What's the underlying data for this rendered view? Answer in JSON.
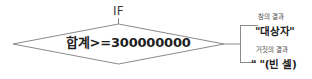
{
  "diagram": {
    "type": "if-decision-flowchart",
    "keyword_label": "IF",
    "decision": {
      "condition_text": "합계>=300000000"
    },
    "branches": {
      "true": {
        "caption": "참의 결과",
        "value": "\"대상자\""
      },
      "false": {
        "caption": "거짓의 결과",
        "value": "\" \"(빈 셀)"
      }
    }
  },
  "style": {
    "line_color": "#8a8a8a",
    "text_color": "#1e1e1e",
    "caption_color": "#4a4a4a",
    "background": "#ffffff"
  }
}
